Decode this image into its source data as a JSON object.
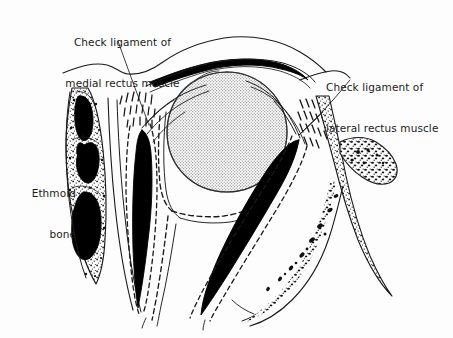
{
  "figure": {
    "background_color": "#fdfdfd",
    "ink_color": "#1a1a1a",
    "globe_fill_color": "#d0d0d0",
    "muscle_fill_color": "#000000"
  },
  "labels": {
    "medial_check_ligament": {
      "line1": "Check ligament of",
      "line2": "medial rectus muscle"
    },
    "lateral_check_ligament": {
      "line1": "Check ligament of",
      "line2": "lateral rectus muscle"
    },
    "ethmoid_bone": {
      "line1": "Ethmoid",
      "line2": "bone"
    }
  },
  "structures": {
    "globe": "eyeball-globe",
    "medial_rectus": "medial-rectus-muscle",
    "lateral_rectus": "lateral-rectus-muscle",
    "ethmoid": "ethmoid-air-cells",
    "zygomatic": "lateral-orbital-wall",
    "eyelid": "upper-eyelid-tarsal-plate",
    "fascia": "tenon-capsule-fascial-sheath"
  }
}
